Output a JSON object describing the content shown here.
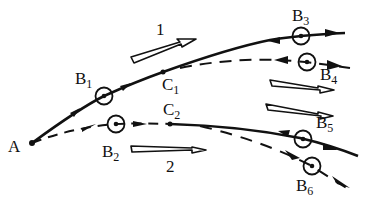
{
  "diagram": {
    "colors": {
      "ink": "#111111",
      "background": "#ffffff"
    },
    "labels": {
      "A": {
        "main": "A",
        "sub": ""
      },
      "B1": {
        "main": "B",
        "sub": "1"
      },
      "B2": {
        "main": "B",
        "sub": "2"
      },
      "B3": {
        "main": "B",
        "sub": "3"
      },
      "B4": {
        "main": "B",
        "sub": "4"
      },
      "B5": {
        "main": "B",
        "sub": "5"
      },
      "B6": {
        "main": "B",
        "sub": "6"
      },
      "C1": {
        "main": "C",
        "sub": "1"
      },
      "C2": {
        "main": "C",
        "sub": "2"
      },
      "wind1": "1",
      "wind2": "2"
    },
    "curves": [
      {
        "id": "upper-solid",
        "style": "solid",
        "from": "A",
        "through": [
          "B1",
          "C1"
        ],
        "to": "B3"
      },
      {
        "id": "upper-dashed",
        "style": "dashed",
        "from": "C1",
        "to": "B4"
      },
      {
        "id": "lower-dashed",
        "style": "dashed",
        "from": "A",
        "through": [
          "B2"
        ],
        "to": "C2"
      },
      {
        "id": "lower-solid",
        "style": "solid",
        "from": "C2",
        "to": "B5"
      },
      {
        "id": "lower-dashed-2",
        "style": "dashed",
        "from": "C2",
        "to": "B6"
      }
    ],
    "wind_arrows": [
      {
        "label": "1",
        "direction": "upper-right"
      },
      {
        "label": "",
        "direction": "right-slight-down"
      },
      {
        "label": "",
        "direction": "right-slight-down"
      },
      {
        "label": "2",
        "direction": "right"
      },
      {
        "label": "",
        "direction": "right-slight-down"
      }
    ]
  }
}
